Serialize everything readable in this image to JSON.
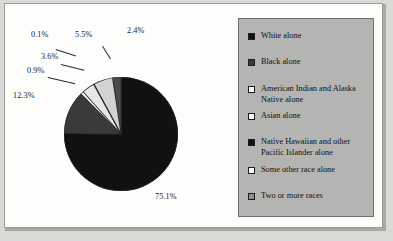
{
  "figure": {
    "background_color": "#fdfdfb",
    "frame_color": "#9b9b98",
    "legend_background": "#b4b4b2"
  },
  "legend": {
    "items": [
      {
        "label": "White alone",
        "swatch_color": "#111111",
        "swatch_name": "legend-swatch-white-alone"
      },
      {
        "label": "Black alone",
        "swatch_color": "#3a3a3a",
        "swatch_name": "legend-swatch-black-alone"
      },
      {
        "label": "American Indian and Alaska Native alone",
        "swatch_color": "#fbfbfb",
        "swatch_name": "legend-swatch-american-indian-alaska-native-alone"
      },
      {
        "label": "Asian alone",
        "swatch_color": "#fbfbfb",
        "swatch_name": "legend-swatch-asian-alone"
      },
      {
        "label": "Native Hawaiian and other Pacific Islander alone",
        "swatch_color": "#111111",
        "swatch_name": "legend-swatch-native-hawaiian-pacific-islander-alone"
      },
      {
        "label": "Some other race alone",
        "swatch_color": "#fbfbfb",
        "swatch_name": "legend-swatch-some-other-race-alone"
      },
      {
        "label": "Two or more races",
        "swatch_color": "#8d8d8b",
        "swatch_name": "legend-swatch-two-or-more-races"
      }
    ]
  },
  "chart_data": {
    "type": "pie",
    "title": "",
    "legend_position": "right",
    "start_angle_clock": 12,
    "direction": "clockwise",
    "categories": [
      "White alone",
      "Black alone",
      "American Indian and Alaska Native alone",
      "Asian alone",
      "Native Hawaiian and other Pacific Islander alone",
      "Some other race alone",
      "Two or more races"
    ],
    "values": [
      75.1,
      12.3,
      0.9,
      3.6,
      0.1,
      5.5,
      2.4
    ],
    "unit": "percent",
    "labels": [
      "75.1%",
      "12.3%",
      "0.9%",
      "3.6%",
      "0.1%",
      "5.5%",
      "2.4%"
    ],
    "colors": [
      "#111111",
      "#3a3a3a",
      "#fbfbfb",
      "#e6e6e6",
      "#111111",
      "#d2d2d2",
      "#4a4a4a"
    ]
  }
}
